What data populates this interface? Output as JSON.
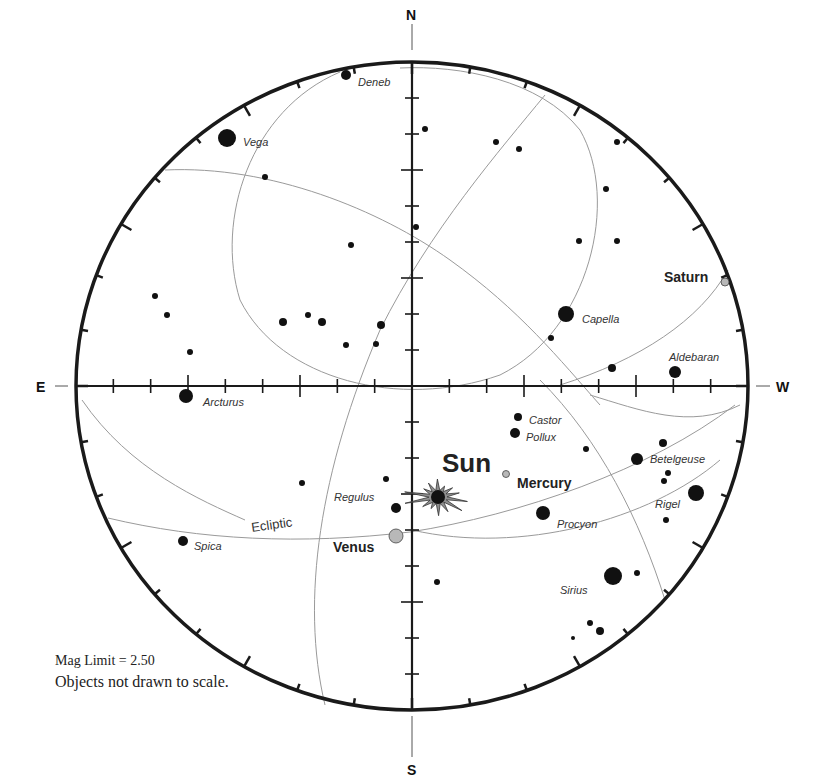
{
  "chart": {
    "center": [
      412,
      386
    ],
    "radius_x": 336,
    "radius_y": 324,
    "colors": {
      "horizon": "#1a1a1a",
      "axis": "#1a1a1a",
      "grid_curve": "#9a9a9a",
      "star": "#111111",
      "planet_fill": "#b8b8b8",
      "sun_fill": "#8e8e8e"
    }
  },
  "directions": {
    "north": "N",
    "south": "S",
    "east": "E",
    "west": "W"
  },
  "curves": [
    {
      "name": "ecliptic",
      "d": "M108,518 C200,540 300,545 410,532 C520,515 650,470 735,405"
    },
    {
      "name": "ecliptic-upper-arc",
      "d": "M412,530 C520,555 650,520 720,460"
    },
    {
      "name": "circle-near-pole",
      "d": "M340,72 C250,110 215,220 240,300 C280,380 400,410 500,375 C590,330 620,200 580,130 C540,80 460,65 400,68"
    },
    {
      "name": "great-circle-a",
      "d": "M165,170 C270,165 380,210 450,260 C520,310 560,360 600,405"
    },
    {
      "name": "great-circle-b",
      "d": "M325,705 C300,600 320,470 380,330 C430,230 500,150 545,95"
    },
    {
      "name": "great-circle-c",
      "d": "M82,400 C130,470 200,500 245,520"
    },
    {
      "name": "great-circle-d",
      "d": "M540,380 C600,440 640,520 665,600"
    },
    {
      "name": "great-circle-e",
      "d": "M560,385 C640,360 700,320 728,270"
    },
    {
      "name": "great-circle-f",
      "d": "M590,395 C640,410 690,430 740,405"
    }
  ],
  "stars": [
    {
      "name": "Deneb",
      "x": 346,
      "y": 75,
      "r": 5,
      "label": "Deneb",
      "lx": 358,
      "ly": 86
    },
    {
      "name": "Vega",
      "x": 227,
      "y": 138,
      "r": 9,
      "label": "Vega",
      "lx": 243,
      "ly": 146
    },
    {
      "name": "Capella",
      "x": 566,
      "y": 314,
      "r": 8,
      "label": "Capella",
      "lx": 582,
      "ly": 323
    },
    {
      "name": "Aldebaran",
      "x": 675,
      "y": 372,
      "r": 6,
      "label": "Aldebaran",
      "lx": 669,
      "ly": 361
    },
    {
      "name": "Arcturus",
      "x": 186,
      "y": 396,
      "r": 7,
      "label": "Arcturus",
      "lx": 203,
      "ly": 406
    },
    {
      "name": "Castor",
      "x": 518,
      "y": 417,
      "r": 4,
      "label": "Castor",
      "lx": 529,
      "ly": 424
    },
    {
      "name": "Pollux",
      "x": 515,
      "y": 433,
      "r": 5,
      "label": "Pollux",
      "lx": 526,
      "ly": 441
    },
    {
      "name": "Betelgeuse",
      "x": 637,
      "y": 459,
      "r": 6,
      "label": "Betelgeuse",
      "lx": 650,
      "ly": 463
    },
    {
      "name": "Rigel",
      "x": 696,
      "y": 493,
      "r": 8,
      "label": "Rigel",
      "lx": 655,
      "ly": 508
    },
    {
      "name": "Regulus",
      "x": 396,
      "y": 508,
      "r": 5,
      "label": "Regulus",
      "lx": 334,
      "ly": 501
    },
    {
      "name": "Procyon",
      "x": 543,
      "y": 513,
      "r": 7,
      "label": "Procyon",
      "lx": 557,
      "ly": 528
    },
    {
      "name": "Spica",
      "x": 183,
      "y": 541,
      "r": 5,
      "label": "Spica",
      "lx": 194,
      "ly": 550
    },
    {
      "name": "Sirius",
      "x": 613,
      "y": 576,
      "r": 9,
      "label": "Sirius",
      "lx": 560,
      "ly": 594
    },
    {
      "name": "",
      "x": 425,
      "y": 129,
      "r": 3
    },
    {
      "name": "",
      "x": 265,
      "y": 177,
      "r": 3
    },
    {
      "name": "",
      "x": 496,
      "y": 142,
      "r": 3
    },
    {
      "name": "",
      "x": 519,
      "y": 149,
      "r": 3
    },
    {
      "name": "",
      "x": 606,
      "y": 189,
      "r": 3
    },
    {
      "name": "",
      "x": 617,
      "y": 142,
      "r": 3
    },
    {
      "name": "",
      "x": 416,
      "y": 227,
      "r": 3
    },
    {
      "name": "",
      "x": 351,
      "y": 245,
      "r": 3
    },
    {
      "name": "",
      "x": 579,
      "y": 241,
      "r": 3
    },
    {
      "name": "",
      "x": 617,
      "y": 241,
      "r": 3
    },
    {
      "name": "",
      "x": 155,
      "y": 296,
      "r": 3
    },
    {
      "name": "",
      "x": 167,
      "y": 315,
      "r": 3
    },
    {
      "name": "",
      "x": 283,
      "y": 322,
      "r": 4
    },
    {
      "name": "",
      "x": 308,
      "y": 315,
      "r": 3
    },
    {
      "name": "",
      "x": 322,
      "y": 322,
      "r": 4
    },
    {
      "name": "",
      "x": 381,
      "y": 325,
      "r": 4
    },
    {
      "name": "",
      "x": 346,
      "y": 345,
      "r": 3
    },
    {
      "name": "",
      "x": 376,
      "y": 344,
      "r": 3
    },
    {
      "name": "",
      "x": 551,
      "y": 338,
      "r": 3
    },
    {
      "name": "",
      "x": 190,
      "y": 352,
      "r": 3
    },
    {
      "name": "",
      "x": 612,
      "y": 368,
      "r": 4
    },
    {
      "name": "",
      "x": 586,
      "y": 449,
      "r": 3
    },
    {
      "name": "",
      "x": 663,
      "y": 443,
      "r": 4
    },
    {
      "name": "",
      "x": 668,
      "y": 473,
      "r": 3
    },
    {
      "name": "",
      "x": 664,
      "y": 481,
      "r": 3
    },
    {
      "name": "",
      "x": 666,
      "y": 520,
      "r": 3
    },
    {
      "name": "",
      "x": 302,
      "y": 483,
      "r": 3
    },
    {
      "name": "",
      "x": 386,
      "y": 479,
      "r": 3
    },
    {
      "name": "",
      "x": 437,
      "y": 582,
      "r": 3
    },
    {
      "name": "",
      "x": 637,
      "y": 573,
      "r": 3
    },
    {
      "name": "",
      "x": 590,
      "y": 623,
      "r": 3
    },
    {
      "name": "",
      "x": 600,
      "y": 631,
      "r": 4
    },
    {
      "name": "",
      "x": 573,
      "y": 638,
      "r": 2
    }
  ],
  "planets": [
    {
      "name": "Saturn",
      "x": 725,
      "y": 282,
      "r": 4,
      "label": "Saturn",
      "lx": 664,
      "ly": 282
    },
    {
      "name": "Mercury",
      "x": 506,
      "y": 474,
      "r": 3.5,
      "label": "Mercury",
      "lx": 517,
      "ly": 488
    },
    {
      "name": "Venus",
      "x": 396,
      "y": 536,
      "r": 7,
      "label": "Venus",
      "lx": 333,
      "ly": 552
    }
  ],
  "sun": {
    "label": "Sun",
    "x": 438,
    "y": 497,
    "lx": 442,
    "ly": 472
  },
  "ecliptic_label": {
    "text": "Ecliptic",
    "x": 252,
    "y": 532,
    "rotate": -8
  },
  "footer": {
    "mag_limit_label": "Mag Limit =",
    "mag_limit_value": "2.50",
    "scale_note": "Objects not drawn to scale."
  }
}
